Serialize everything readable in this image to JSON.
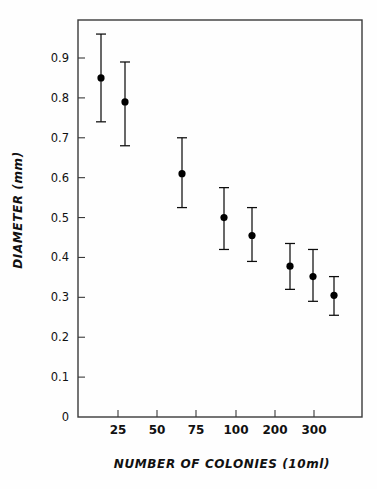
{
  "chart_data": {
    "type": "scatter",
    "title": "",
    "xlabel": "NUMBER OF COLONIES (10ml)",
    "ylabel": "DIAMETER (mm)",
    "grid": false,
    "legend": false,
    "x_tick_labels": [
      "25",
      "50",
      "75",
      "100",
      "200",
      "300"
    ],
    "x_tick_values": [
      25,
      50,
      75,
      100,
      200,
      300
    ],
    "x_scale": "ordinal-log-like",
    "y_tick_labels": [
      "0",
      "0.1",
      "0.2",
      "0.3",
      "0.4",
      "0.5",
      "0.6",
      "0.7",
      "0.8",
      "0.9"
    ],
    "y_tick_values": [
      0,
      0.1,
      0.2,
      0.3,
      0.4,
      0.5,
      0.6,
      0.7,
      0.8,
      0.9
    ],
    "ylim": [
      0,
      0.98
    ],
    "error_type": "error-bars",
    "marker": "filled-circle",
    "series": [
      {
        "name": "colony diameter",
        "points": [
          {
            "x_label": "15",
            "x_pos": 101,
            "y": 0.85,
            "y_low": 0.74,
            "y_high": 0.96
          },
          {
            "x_label": "30",
            "x_pos": 125,
            "y": 0.79,
            "y_low": 0.68,
            "y_high": 0.89
          },
          {
            "x_label": "65",
            "x_pos": 182,
            "y": 0.61,
            "y_low": 0.525,
            "y_high": 0.7
          },
          {
            "x_label": "90",
            "x_pos": 224,
            "y": 0.5,
            "y_low": 0.42,
            "y_high": 0.575
          },
          {
            "x_label": "120",
            "x_pos": 252,
            "y": 0.455,
            "y_low": 0.39,
            "y_high": 0.525
          },
          {
            "x_label": "220",
            "x_pos": 290,
            "y": 0.378,
            "y_low": 0.32,
            "y_high": 0.435
          },
          {
            "x_label": "280",
            "x_pos": 313,
            "y": 0.352,
            "y_low": 0.29,
            "y_high": 0.42
          },
          {
            "x_label": "330",
            "x_pos": 334,
            "y": 0.305,
            "y_low": 0.255,
            "y_high": 0.352
          }
        ]
      }
    ]
  },
  "colors": {
    "marker": "#000000",
    "axis": "#3a3a3a",
    "background": "#fefefe"
  }
}
